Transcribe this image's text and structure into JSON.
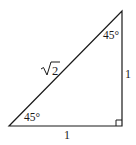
{
  "diagram": {
    "type": "right-isosceles-triangle",
    "line_color": "#1a1a1a",
    "vertices": {
      "bottom_left": [
        9,
        126
      ],
      "bottom_right": [
        122,
        126
      ],
      "top_right": [
        122,
        11
      ]
    },
    "labels": {
      "hypotenuse": "√2",
      "hypotenuse_radicand": "2",
      "right_side": "1",
      "bottom_side": "1",
      "top_angle": "45°",
      "bottom_left_angle": "45°"
    },
    "right_angle_marker": true
  }
}
